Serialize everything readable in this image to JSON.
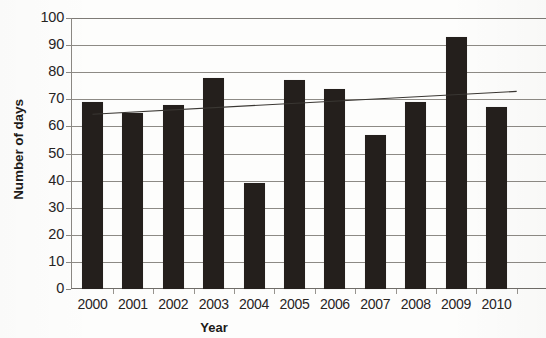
{
  "chart_data": {
    "type": "bar",
    "title": "",
    "subtitle": "",
    "xlabel": "Year",
    "ylabel": "Number of days",
    "categories": [
      "2000",
      "2001",
      "2002",
      "2003",
      "2004",
      "2005",
      "2006",
      "2007",
      "2008",
      "2009",
      "2010"
    ],
    "values": [
      69,
      65,
      68,
      78,
      39,
      77,
      74,
      57,
      69,
      93,
      67
    ],
    "series": [
      {
        "name": "Number of days",
        "type": "bar",
        "values": [
          69,
          65,
          68,
          78,
          39,
          77,
          74,
          57,
          69,
          93,
          67
        ]
      },
      {
        "name": "Linear trendline",
        "type": "line",
        "values": [
          64.5,
          65.3,
          66.2,
          67.0,
          67.8,
          68.7,
          69.5,
          70.3,
          71.2,
          72.0,
          72.9
        ]
      }
    ],
    "ylim": [
      0,
      100
    ],
    "ytick_labels": [
      "0",
      "10",
      "20",
      "30",
      "40",
      "50",
      "60",
      "70",
      "80",
      "90",
      "100"
    ],
    "ytick_values": [
      0,
      10,
      20,
      30,
      40,
      50,
      60,
      70,
      80,
      90,
      100
    ],
    "ytick_step": 10,
    "xtick_labels": [
      "2000",
      "2001",
      "2002",
      "2003",
      "2004",
      "2005",
      "2006",
      "2007",
      "2008",
      "2009",
      "2010"
    ],
    "grid": true,
    "grid_axis": "y",
    "legend": false,
    "legend_position": "none",
    "bar_color": "#241f1c",
    "gridline_color": "#7e7b76",
    "axis_color": "#8a8782",
    "trendline_color": "#3a3733",
    "background_color": "#fdfdfc",
    "annotations": []
  }
}
